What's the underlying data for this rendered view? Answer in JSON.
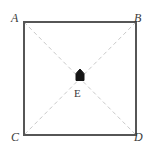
{
  "figure": {
    "type": "geometry-diagram",
    "shape": "square",
    "width": 151,
    "height": 151,
    "background_color": "#ffffff",
    "square": {
      "name": "ABDC",
      "left": 24,
      "top": 22,
      "right": 136,
      "bottom": 135,
      "stroke_color": "#565656",
      "stroke_width": 2,
      "fill": "none"
    },
    "diagonals": {
      "stroke_color": "#c9c9c9",
      "stroke_width": 1,
      "dash_pattern": "4 3",
      "segments": [
        {
          "name": "diagonal-A-D",
          "from": "A",
          "to": "D"
        },
        {
          "name": "diagonal-B-C",
          "from": "B",
          "to": "C"
        }
      ]
    },
    "vertices": [
      {
        "id": "A",
        "label": "A",
        "position": "top-left",
        "x": 24,
        "y": 22
      },
      {
        "id": "B",
        "label": "B",
        "position": "top-right",
        "x": 136,
        "y": 22
      },
      {
        "id": "C",
        "label": "C",
        "position": "bottom-left",
        "x": 24,
        "y": 135
      },
      {
        "id": "D",
        "label": "D",
        "position": "bottom-right",
        "x": 136,
        "y": 135
      }
    ],
    "center_point": {
      "id": "E",
      "label": "E",
      "x": 80,
      "y": 78,
      "marker": "pentagon-house-marker",
      "marker_fill": "#1a1a1a",
      "marker_stroke": "#1a1a1a"
    }
  }
}
